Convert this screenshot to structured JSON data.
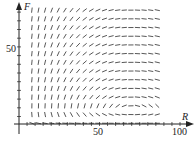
{
  "chart_data": {
    "type": "direction-field",
    "title": "",
    "xlabel": "R",
    "ylabel": "F",
    "x_ticks_labeled": [
      50,
      100
    ],
    "y_ticks_labeled": [
      50
    ],
    "xlim": [
      0,
      100
    ],
    "ylim": [
      0,
      80
    ],
    "grid": false,
    "model": {
      "description": "Predator-prey direction field dR/dt = R(a - bF), dF/dt = F(-c + dR)",
      "a": 0.1,
      "b": 0.01,
      "c": 0.7,
      "d": 0.01,
      "equilibrium": {
        "R": 70,
        "F": 10
      }
    },
    "field_grid": {
      "columns": 20,
      "rows": 14,
      "R_start": 5,
      "R_step": 5,
      "F_start": 0.5,
      "F_step": 5.8
    }
  },
  "axes": {
    "x_label": "R",
    "y_label": "F",
    "x_tick_50": "50",
    "x_tick_100": "100",
    "y_tick_50": "50"
  },
  "colors": {
    "ink": "#222222",
    "segment": "#444444"
  }
}
